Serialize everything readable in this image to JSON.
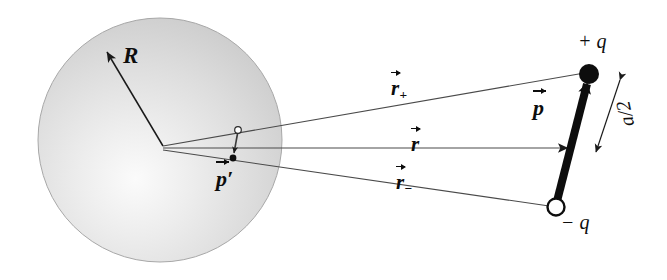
{
  "figure": {
    "background_color": "#ffffff",
    "ink_color": "#0d0d0d"
  },
  "sphere": {
    "name": "conducting-sphere",
    "center": {
      "x": 160,
      "y": 140
    },
    "radius": 122,
    "fill_light": "#f2f2f2",
    "fill_dark": "#c6c6c6",
    "outline_color": "#9a9a9a",
    "radius_label": "R"
  },
  "image_dipole": {
    "name": "image-dipole",
    "label": "p",
    "label_prime": "′",
    "positive_end": {
      "x": 238,
      "y": 131
    },
    "negative_end": {
      "x": 233,
      "y": 157
    },
    "marker_open_color": "#ffffff",
    "marker_filled_color": "#0d0d0d"
  },
  "dipole": {
    "name": "source-dipole",
    "label": "p",
    "positive_charge": {
      "label_sign": "+",
      "label_symbol": "q",
      "label": "+ q",
      "x": 589,
      "y": 74,
      "marker": "filled-circle",
      "radius": 10
    },
    "negative_charge": {
      "label_sign": "−",
      "label_symbol": "q",
      "label": "− q",
      "x": 556,
      "y": 207,
      "marker": "open-circle",
      "radius": 9
    },
    "separation_label": "a/2",
    "arrow_color": "#0d0d0d",
    "arrow_width": 8
  },
  "vectors": [
    {
      "name": "r-plus",
      "label": "r",
      "subscript": "+",
      "from": {
        "x": 163,
        "y": 146
      },
      "to": {
        "x": 589,
        "y": 74
      },
      "color": "#4a4a4a"
    },
    {
      "name": "r",
      "label": "r",
      "subscript": "",
      "from": {
        "x": 163,
        "y": 148
      },
      "to": {
        "x": 572,
        "y": 148
      },
      "color": "#4a4a4a"
    },
    {
      "name": "r-minus",
      "label": "r",
      "subscript": "−",
      "from": {
        "x": 163,
        "y": 150
      },
      "to": {
        "x": 556,
        "y": 207
      },
      "color": "#4a4a4a"
    }
  ]
}
